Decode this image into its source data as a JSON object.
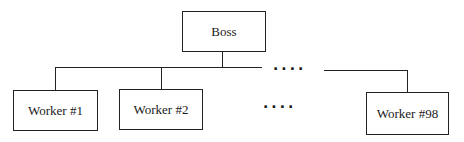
{
  "diagram": {
    "type": "org-chart",
    "root": {
      "label": "Boss"
    },
    "children": [
      {
        "label": "Worker #1"
      },
      {
        "label": "Worker #2"
      },
      {
        "label": "Worker #98"
      }
    ],
    "ellipsis_connector": "····",
    "ellipsis_nodes": "····",
    "edges": [
      {
        "from": "Boss",
        "to": "Worker #1"
      },
      {
        "from": "Boss",
        "to": "Worker #2"
      },
      {
        "from": "Boss",
        "to": "Worker #98"
      }
    ]
  }
}
